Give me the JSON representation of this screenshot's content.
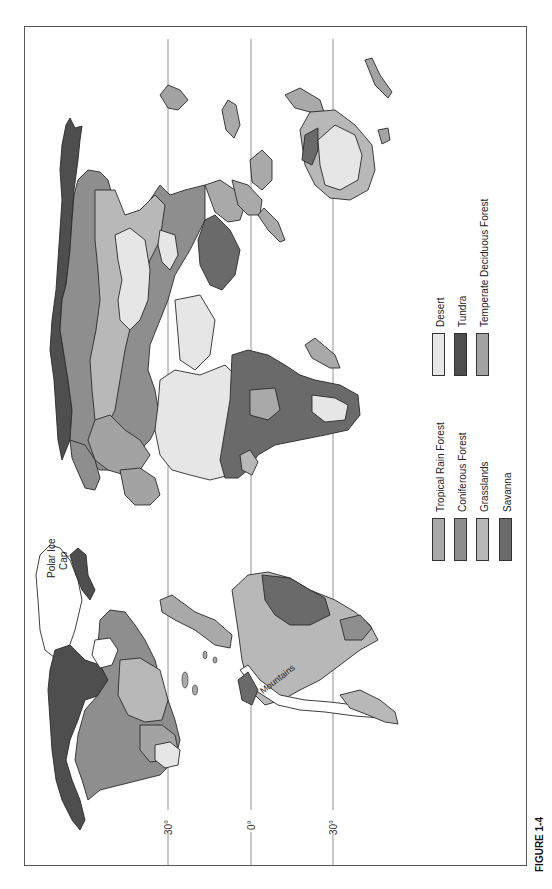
{
  "figure": {
    "caption": "FIGURE 1-4",
    "orientation": "rotated 90° counterclockwise (north on left)"
  },
  "latitude_lines": [
    {
      "label": "30°",
      "meaning": "30°N"
    },
    {
      "label": "0°",
      "meaning": "Equator"
    },
    {
      "label": "30°",
      "meaning": "30°S"
    }
  ],
  "map_labels": {
    "polar_ice_cap_line1": "Polar Ice",
    "polar_ice_cap_line2": "Cap",
    "mountains": "Mountains"
  },
  "legend": {
    "items": [
      {
        "label": "Tropical Rain Forest",
        "color": "#a9a9a9"
      },
      {
        "label": "Coniferous Forest",
        "color": "#8e8e8e"
      },
      {
        "label": "Grasslands",
        "color": "#b8b8b8"
      },
      {
        "label": "Savanna",
        "color": "#6a6a6a"
      },
      {
        "label": "Desert",
        "color": "#e6e6e6"
      },
      {
        "label": "Tundra",
        "color": "#4e4e4e"
      },
      {
        "label": "Temperate Deciduous Forest",
        "color": "#a3a3a3"
      }
    ]
  },
  "colors": {
    "frame": "#555555",
    "coastline": "#2a2a2a",
    "background": "#ffffff",
    "ice_cap": "#ffffff"
  }
}
